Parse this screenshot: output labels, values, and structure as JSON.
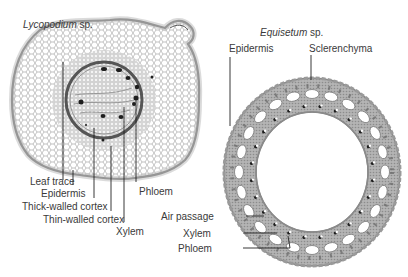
{
  "diagrams": [
    {
      "id": "lycopodium",
      "title_genus": "Lycopodium",
      "title_suffix": " sp.",
      "labels": [
        {
          "text": "Leaf trace"
        },
        {
          "text": "Epidermis"
        },
        {
          "text": "Thick-walled cortex"
        },
        {
          "text": "Thin-walled cortex"
        },
        {
          "text": "Xylem"
        },
        {
          "text": "Phloem"
        }
      ]
    },
    {
      "id": "equisetum",
      "title_genus": "Equisetum",
      "title_suffix": " sp.",
      "labels": [
        {
          "text": "Epidermis"
        },
        {
          "text": "Sclerenchyma"
        },
        {
          "text": "Air passage"
        },
        {
          "text": "Xylem"
        },
        {
          "text": "Phloem"
        }
      ]
    }
  ],
  "colors": {
    "text": "#3a3a3a",
    "leader": "#222222",
    "cell_wall": "#8a8a8a",
    "ring_fill": "#a9a9a9",
    "ring_dark": "#6e6e6e",
    "vascular_dot": "#1e1e1e"
  }
}
